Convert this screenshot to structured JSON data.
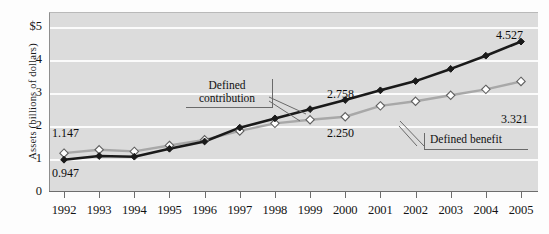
{
  "chart_data": {
    "type": "line",
    "title": "",
    "xlabel": "",
    "ylabel": "Assets (billions of dollars)",
    "categories": [
      "1992",
      "1993",
      "1994",
      "1995",
      "1996",
      "1997",
      "1998",
      "1999",
      "2000",
      "2001",
      "2002",
      "2003",
      "2004",
      "2005"
    ],
    "ylim": [
      0,
      5
    ],
    "yticks": [
      "0",
      "1",
      "2",
      "3",
      "4",
      "$5"
    ],
    "grid": true,
    "legend_position": "callout-annotations",
    "series": [
      {
        "name": "Defined contribution",
        "color": "#1a1a1a",
        "marker": "filled-diamond",
        "values": [
          0.947,
          1.06,
          1.04,
          1.28,
          1.5,
          1.92,
          2.2,
          2.48,
          2.758,
          3.05,
          3.33,
          3.7,
          4.1,
          4.527
        ]
      },
      {
        "name": "Defined benefit",
        "color": "#a8a8a8",
        "marker": "open-diamond",
        "values": [
          1.147,
          1.25,
          1.2,
          1.38,
          1.55,
          1.82,
          2.05,
          2.16,
          2.25,
          2.58,
          2.72,
          2.9,
          3.08,
          3.321
        ]
      }
    ],
    "data_labels": [
      {
        "text": "1.147",
        "series": "Defined benefit",
        "category": "1992"
      },
      {
        "text": "0.947",
        "series": "Defined contribution",
        "category": "1992"
      },
      {
        "text": "2.758",
        "series": "Defined contribution",
        "category": "2000"
      },
      {
        "text": "2.250",
        "series": "Defined benefit",
        "category": "2000"
      },
      {
        "text": "4.527",
        "series": "Defined contribution",
        "category": "2005"
      },
      {
        "text": "3.321",
        "series": "Defined benefit",
        "category": "2005"
      }
    ],
    "annotations": [
      {
        "name": "defined-contribution-callout",
        "text": "Defined\ncontribution"
      },
      {
        "name": "defined-benefit-callout",
        "text": "Defined benefit"
      }
    ],
    "colors": {
      "plot_background": "#dcdcdc",
      "gridline": "#fbfbfb",
      "axis": "#6d6d6d",
      "defined_contribution": "#1a1a1a",
      "defined_benefit": "#a8a8a8"
    }
  }
}
